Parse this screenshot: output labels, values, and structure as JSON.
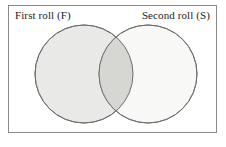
{
  "figure": {
    "type": "venn-diagram",
    "background_color": "#ffffff",
    "frame": {
      "border_color": "#8a8a8a",
      "fill_color": "#ffffff",
      "border_width": 1
    }
  },
  "labels": {
    "left_set": "First roll (F)",
    "right_set": "Second roll (S)"
  },
  "sets": [
    {
      "id": "first-roll",
      "label": "First roll (F)",
      "symbol": "F",
      "cx": 84,
      "cy": 74,
      "r": 49,
      "fill_color": "#e9e9e7",
      "stroke_color": "#6f6f6f"
    },
    {
      "id": "second-roll",
      "label": "Second roll (S)",
      "symbol": "S",
      "cx": 148,
      "cy": 74,
      "r": 49,
      "fill_color": "#f7f7f6",
      "stroke_color": "#6f6f6f"
    }
  ],
  "intersection": {
    "id": "f-and-s",
    "label": "",
    "fill_color": "#d6d6d3"
  },
  "chart_data": {
    "type": "venn",
    "title": "",
    "sets": [
      "First roll (F)",
      "Second roll (S)"
    ],
    "set_symbols": [
      "F",
      "S"
    ],
    "regions": [
      {
        "name": "First roll (F) only",
        "shaded": true,
        "shade": "#e9e9e7"
      },
      {
        "name": "Intersection F and S",
        "shaded": true,
        "shade": "#d6d6d3"
      },
      {
        "name": "Second roll (S) only",
        "shaded": true,
        "shade": "#f7f7f6"
      }
    ],
    "values": [],
    "legend": "none",
    "grid": false
  }
}
